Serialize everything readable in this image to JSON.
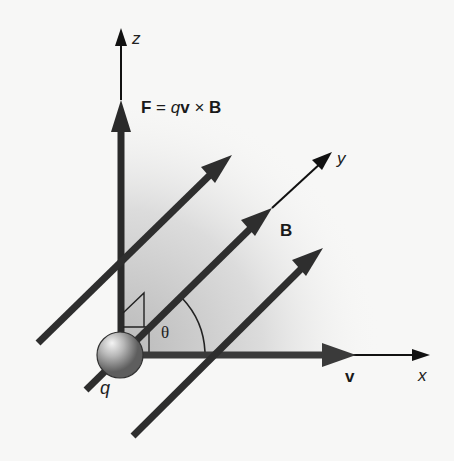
{
  "figure": {
    "formula": {
      "F": "F",
      "eq": " = ",
      "q": "q",
      "v": "v",
      "times": " × ",
      "B": "B"
    },
    "axes": {
      "x": "x",
      "y": "y",
      "z": "z"
    },
    "labels": {
      "charge": "q",
      "velocity": "v",
      "field": "B",
      "angle": "θ"
    },
    "colors": {
      "background": "#f7f7f6",
      "vector": "#2a2a2a",
      "axis": "#111111",
      "shade_dark": "#bdbdbd",
      "shade_light": "#f7f7f6",
      "sphere_light": "#f0f0f0",
      "sphere_dark": "#6a6a6a"
    }
  }
}
